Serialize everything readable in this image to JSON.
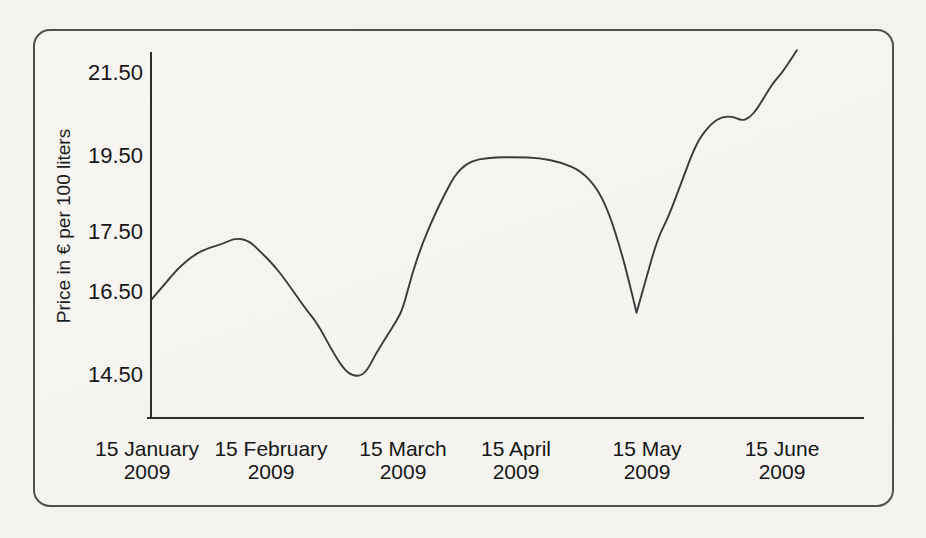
{
  "colors": {
    "paper_background": "#f3f2ef",
    "frame_border": "#4f4f4f",
    "axis_color": "#2d2d2d",
    "line_color": "#3a3a3a",
    "text_color": "#161616"
  },
  "chart_data": {
    "type": "line",
    "title": "",
    "xlabel": "",
    "ylabel": "Price in € per 100 liters",
    "grid": false,
    "legend": "none",
    "ylim": [
      13.4,
      22.1
    ],
    "x_ticks": [
      {
        "day_month": "15 January",
        "year": "2009"
      },
      {
        "day_month": "15 February",
        "year": "2009"
      },
      {
        "day_month": "15 March",
        "year": "2009"
      },
      {
        "day_month": "15 April",
        "year": "2009"
      },
      {
        "day_month": "15 May",
        "year": "2009"
      },
      {
        "day_month": "15 June",
        "year": "2009"
      }
    ],
    "y_ticks": [
      {
        "label": "21.50",
        "value": 21.5
      },
      {
        "label": "19.50",
        "value": 19.5
      },
      {
        "label": "17.50",
        "value": 17.5
      },
      {
        "label": "16.50",
        "value": 16.5
      },
      {
        "label": "14.50",
        "value": 14.5
      }
    ],
    "approx_values_at_labeled_dates": {
      "15 January 2009": 16.3,
      "15 February 2009": 17.0,
      "15 March 2009": 16.1,
      "15 April 2009": 19.5,
      "15 May 2009": 16.6,
      "15 June 2009": 21.5
    },
    "series": [
      {
        "x_unit": "months after 15 January 2009",
        "y_unit": "EUR per 100 liters",
        "points": [
          [
            0.03,
            16.3
          ],
          [
            0.14,
            16.62
          ],
          [
            0.25,
            16.9
          ],
          [
            0.38,
            17.12
          ],
          [
            0.5,
            17.24
          ],
          [
            0.61,
            17.3
          ],
          [
            0.71,
            17.4
          ],
          [
            0.82,
            17.36
          ],
          [
            0.92,
            17.16
          ],
          [
            1.0,
            17.0
          ],
          [
            1.11,
            16.7
          ],
          [
            1.26,
            16.1
          ],
          [
            1.35,
            15.75
          ],
          [
            1.47,
            15.05
          ],
          [
            1.55,
            14.65
          ],
          [
            1.62,
            14.47
          ],
          [
            1.71,
            14.5
          ],
          [
            1.8,
            15.05
          ],
          [
            1.88,
            15.45
          ],
          [
            1.95,
            15.8
          ],
          [
            2.0,
            16.1
          ],
          [
            2.08,
            16.8
          ],
          [
            2.17,
            17.3
          ],
          [
            2.28,
            17.95
          ],
          [
            2.37,
            18.5
          ],
          [
            2.46,
            19.0
          ],
          [
            2.56,
            19.3
          ],
          [
            2.67,
            19.42
          ],
          [
            2.82,
            19.46
          ],
          [
            3.0,
            19.47
          ],
          [
            3.18,
            19.45
          ],
          [
            3.35,
            19.33
          ],
          [
            3.5,
            19.1
          ],
          [
            3.62,
            18.65
          ],
          [
            3.71,
            18.0
          ],
          [
            3.8,
            17.2
          ],
          [
            3.86,
            16.7
          ],
          [
            3.92,
            16.0
          ],
          [
            3.99,
            16.7
          ],
          [
            4.08,
            17.4
          ],
          [
            4.16,
            17.9
          ],
          [
            4.27,
            18.95
          ],
          [
            4.37,
            19.85
          ],
          [
            4.48,
            20.3
          ],
          [
            4.56,
            20.45
          ],
          [
            4.64,
            20.45
          ],
          [
            4.7,
            20.35
          ],
          [
            4.76,
            20.42
          ],
          [
            4.82,
            20.65
          ],
          [
            4.93,
            21.25
          ],
          [
            5.0,
            21.5
          ],
          [
            5.06,
            21.8
          ],
          [
            5.11,
            22.05
          ]
        ]
      }
    ]
  }
}
